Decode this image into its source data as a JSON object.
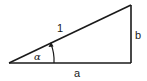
{
  "diagram": {
    "type": "right-triangle",
    "labels": {
      "hypotenuse": "1",
      "vertical_side": "b",
      "horizontal_side": "a",
      "angle": "α"
    },
    "colors": {
      "stroke": "#1a1a1a",
      "background": "#ffffff"
    }
  }
}
